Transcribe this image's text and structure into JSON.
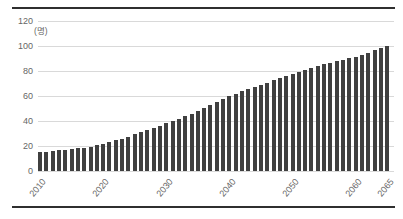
{
  "chart_data": {
    "type": "bar",
    "title": "",
    "unit_label": "(명)",
    "ylabel": "(명)",
    "xlabel": "",
    "ylim": [
      0,
      120
    ],
    "yticks": [
      0,
      20,
      40,
      60,
      80,
      100,
      120
    ],
    "xtick_labels": [
      "2010",
      "2020",
      "2030",
      "2040",
      "2050",
      "2060",
      "2065"
    ],
    "grid": true,
    "legend": "none",
    "years": [
      2010,
      2011,
      2012,
      2013,
      2014,
      2015,
      2016,
      2017,
      2018,
      2019,
      2020,
      2021,
      2022,
      2023,
      2024,
      2025,
      2026,
      2027,
      2028,
      2029,
      2030,
      2031,
      2032,
      2033,
      2034,
      2035,
      2036,
      2037,
      2038,
      2039,
      2040,
      2041,
      2042,
      2043,
      2044,
      2045,
      2046,
      2047,
      2048,
      2049,
      2050,
      2051,
      2052,
      2053,
      2054,
      2055,
      2056,
      2057,
      2058,
      2059,
      2060,
      2061,
      2062,
      2063,
      2064,
      2065
    ],
    "values": [
      15.0,
      15.5,
      16.0,
      16.5,
      17.0,
      17.5,
      18.2,
      18.8,
      19.6,
      20.6,
      21.7,
      23.0,
      24.5,
      26.0,
      27.6,
      29.3,
      31.0,
      32.7,
      34.5,
      36.3,
      38.2,
      40.1,
      42.0,
      44.0,
      46.0,
      48.0,
      50.3,
      52.7,
      55.1,
      57.6,
      60.1,
      62.0,
      63.9,
      65.6,
      67.3,
      69.0,
      70.8,
      72.5,
      74.2,
      75.9,
      77.6,
      79.2,
      80.8,
      82.4,
      83.9,
      85.4,
      86.7,
      88.0,
      89.2,
      90.3,
      91.4,
      93.0,
      94.7,
      96.5,
      98.4,
      100.4
    ],
    "colors": {
      "bar": "#404040",
      "grid": "#d9d9d9",
      "axis_text": "#666666",
      "rule": "#2f2f2f",
      "background": "#ffffff"
    }
  }
}
